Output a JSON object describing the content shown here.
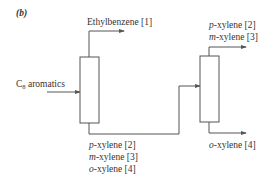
{
  "figure": {
    "panel_label": "(b)",
    "feed": {
      "label_main": "C",
      "label_sub": "8",
      "label_rest": " aromatics"
    },
    "column1": {
      "top_product": "Ethylbenzene [1]",
      "bottom_products": [
        {
          "prefix": "p",
          "rest": "-xylene [2]"
        },
        {
          "prefix": "m",
          "rest": "-xylene [3]"
        },
        {
          "prefix": "o",
          "rest": "-xylene [4]"
        }
      ]
    },
    "column2": {
      "top_products": [
        {
          "prefix": "p",
          "rest": "-xylene [2]"
        },
        {
          "prefix": "m",
          "rest": "-xylene [3]"
        }
      ],
      "bottom_product": {
        "prefix": "o",
        "rest": "-xylene [4]"
      }
    },
    "colors": {
      "line": "#555555",
      "text": "#333333",
      "background": "#ffffff"
    }
  }
}
